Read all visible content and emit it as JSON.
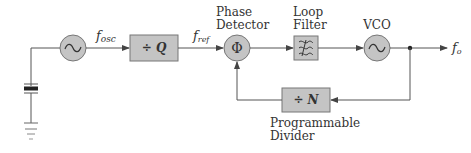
{
  "diagram": {
    "type": "PLL frequency synthesizer block diagram",
    "colors": {
      "line": "#555555",
      "block_fill": "#c4c4c4",
      "block_stroke": "#777777",
      "text": "#333333",
      "background": "#ffffff"
    },
    "blocks": {
      "reference_oscillator": {
        "symbol": "~"
      },
      "reference_divider": {
        "label": "÷ Q"
      },
      "phase_detector": {
        "symbol": "Φ",
        "title_line1": "Phase",
        "title_line2": "Detector"
      },
      "loop_filter": {
        "symbol": "≋",
        "title_line1": "Loop",
        "title_line2": "Filter"
      },
      "vco": {
        "symbol": "~",
        "title": "VCO"
      },
      "programmable_divider": {
        "label": "÷ N",
        "title_line1": "Programmable",
        "title_line2": "Divider"
      }
    },
    "signals": {
      "f_osc": {
        "base": "f",
        "sub": "osc"
      },
      "f_ref": {
        "base": "f",
        "sub": "ref"
      },
      "f_out": {
        "base": "f",
        "sub": "o"
      }
    },
    "components": {
      "crystal": "crystal-resonator",
      "ground": "ground-symbol"
    }
  }
}
